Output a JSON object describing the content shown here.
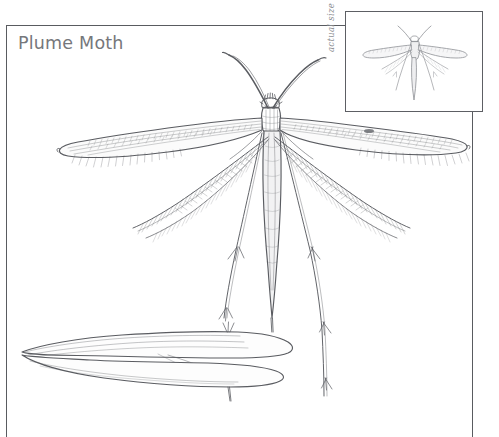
{
  "page": {
    "background_color": "#ffffff",
    "title": "Plume Moth",
    "title_color": "#76777b"
  },
  "frame": {
    "color": "#595b60",
    "top_rule": true,
    "left_rule": true,
    "right_rule": true
  },
  "inset": {
    "label": "actual size",
    "label_color": "#8a8c90",
    "border_color": "#5d5f64",
    "subject": "plume-moth-actual-size"
  },
  "figures": [
    {
      "name": "main-plume-moth-illustration",
      "subject": "Plume Moth",
      "description": "Large ink illustration of a plume moth with divided feathery plume wings, long curved antennae, slender abdomen and long spurred legs",
      "ink_color": "#5a5c61"
    },
    {
      "name": "forewing-detail-illustration",
      "subject": "Forewing detail",
      "description": "Outline drawing of a lobed forewing shown separately at lower left",
      "ink_color": "#5a5c61"
    },
    {
      "name": "inset-plume-moth-illustration",
      "subject": "Plume Moth at actual size",
      "description": "Small grey silhouette-style rendering of the same moth shown at life size inside a boxed inset",
      "ink_color": "#8e9095"
    }
  ],
  "icons": {
    "moth": "moth-icon",
    "wing": "wing-icon"
  }
}
